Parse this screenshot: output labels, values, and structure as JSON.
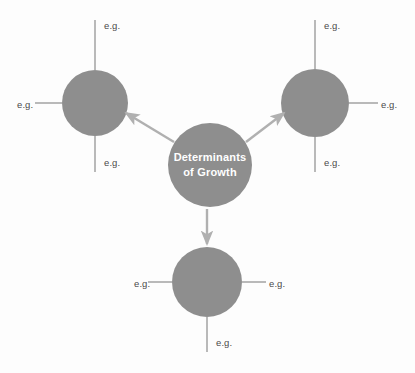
{
  "diagram": {
    "title": "Determinants of Growth",
    "center_node": {
      "label_line1": "Determinants",
      "label_line2": "of Growth",
      "cx": 210,
      "cy": 165,
      "r": 42,
      "fill": "#8e8e8e",
      "text_color": "#ffffff"
    },
    "node_fill": "#8e8e8e",
    "axis_color": "#a8a8a8",
    "arrow_color": "#b0b0b0",
    "background": "#fdfdfd",
    "label_color": "#4a4a4a",
    "cropped_top_text": "",
    "branches": [
      {
        "id": "branch-top-left",
        "cx": 95,
        "cy": 103,
        "r": 33,
        "axes": [
          {
            "dir": "up",
            "label": "e.g.",
            "label_x": 104,
            "label_y": 21
          },
          {
            "dir": "left",
            "label": "e.g.",
            "label_x": 17,
            "label_y": 100
          },
          {
            "dir": "down",
            "label": "e.g.",
            "label_x": 104,
            "label_y": 158
          }
        ]
      },
      {
        "id": "branch-top-right",
        "cx": 315,
        "cy": 103,
        "r": 34,
        "axes": [
          {
            "dir": "up",
            "label": "e.g.",
            "label_x": 324,
            "label_y": 21
          },
          {
            "dir": "right",
            "label": "e.g.",
            "label_x": 381,
            "label_y": 100
          },
          {
            "dir": "down",
            "label": "e.g.",
            "label_x": 324,
            "label_y": 158
          }
        ]
      },
      {
        "id": "branch-bottom",
        "cx": 207,
        "cy": 282,
        "r": 35,
        "axes": [
          {
            "dir": "left",
            "label": "e.g.",
            "label_x": 134,
            "label_y": 279
          },
          {
            "dir": "right",
            "label": "e.g.",
            "label_x": 269,
            "label_y": 279
          },
          {
            "dir": "down",
            "label": "e.g.",
            "label_x": 216,
            "label_y": 338
          }
        ]
      }
    ],
    "arrows": [
      {
        "id": "arrow-to-top-left",
        "x1": 174,
        "y1": 142,
        "x2": 126,
        "y2": 113
      },
      {
        "id": "arrow-to-top-right",
        "x1": 246,
        "y1": 142,
        "x2": 284,
        "y2": 113
      },
      {
        "id": "arrow-to-bottom",
        "x1": 207,
        "y1": 209,
        "x2": 207,
        "y2": 246
      }
    ]
  }
}
